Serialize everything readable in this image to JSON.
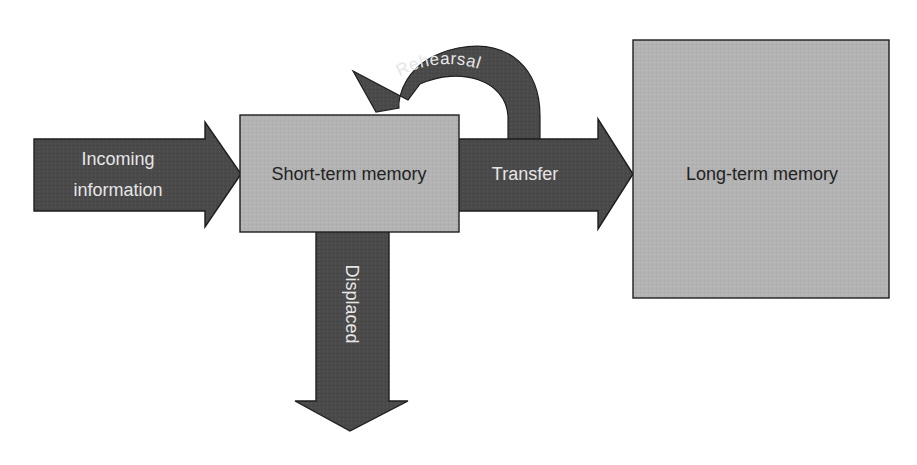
{
  "diagram": {
    "title": "",
    "nodes": [
      {
        "id": "short_term",
        "label": "Short-term memory"
      },
      {
        "id": "long_term",
        "label": "Long-term memory"
      }
    ],
    "arrows": {
      "incoming": {
        "line1": "Incoming",
        "line2": "information"
      },
      "transfer": {
        "label": "Transfer"
      },
      "rehearsal": {
        "label": "Rehearsal"
      },
      "displaced": {
        "label": "Displaced"
      }
    },
    "colors": {
      "arrow_fill": "#4a4a4a",
      "arrow_stroke": "#1e1e1e",
      "box_fill": "#b4b4b4",
      "box_stroke": "#1e1e1e",
      "arrow_text": "#e6e6e6",
      "box_text": "#222222"
    }
  }
}
